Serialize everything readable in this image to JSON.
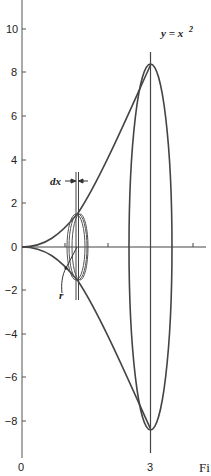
{
  "diagram": {
    "curve_label": "y = x",
    "curve_label_exp": "2",
    "dx_label": "dx",
    "r_label": "r",
    "figure_label": "Fi",
    "y_ticks": [
      "10",
      "8",
      "6",
      "4",
      "2",
      "0",
      "−2",
      "−4",
      "−6",
      "−8"
    ],
    "x_ticks": [
      "0",
      "3"
    ],
    "colors": {
      "stroke": "#444444",
      "text": "#222222",
      "background": "#ffffff"
    }
  }
}
